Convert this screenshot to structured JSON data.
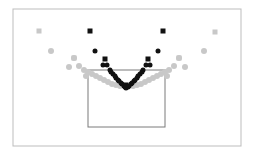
{
  "chart_data": {
    "type": "scatter",
    "title": "",
    "xlabel": "",
    "ylabel": "",
    "grid": false,
    "legend": null,
    "frame": {
      "x": 13,
      "y": 9,
      "w": 228,
      "h": 137,
      "stroke": "#bdbdbd"
    },
    "inner_box": {
      "x": 88,
      "y": 70,
      "w": 77,
      "h": 57,
      "stroke": "#7a7a7a"
    },
    "series": [
      {
        "name": "light",
        "color": "#c8c8c8",
        "marker": "circle",
        "points": [
          [
            51,
            51
          ],
          [
            204,
            51
          ],
          [
            74,
            58
          ],
          [
            179,
            58
          ],
          [
            69,
            67
          ],
          [
            79,
            66
          ],
          [
            174,
            66
          ],
          [
            185,
            67
          ],
          [
            88,
            72
          ],
          [
            92,
            74
          ],
          [
            96,
            76
          ],
          [
            100,
            78
          ],
          [
            104,
            80
          ],
          [
            108,
            82
          ],
          [
            112,
            84
          ],
          [
            116,
            85
          ],
          [
            120,
            86
          ],
          [
            165,
            72
          ],
          [
            161,
            74
          ],
          [
            157,
            76
          ],
          [
            153,
            78
          ],
          [
            149,
            80
          ],
          [
            145,
            82
          ],
          [
            141,
            84
          ],
          [
            137,
            85
          ],
          [
            133,
            86
          ],
          [
            86,
            76
          ],
          [
            167,
            76
          ],
          [
            84,
            70
          ],
          [
            169,
            70
          ]
        ]
      },
      {
        "name": "light-squares",
        "color": "#c8c8c8",
        "marker": "square",
        "points": [
          [
            39,
            31
          ],
          [
            215,
            32
          ],
          [
            179,
            58
          ],
          [
            74,
            58
          ]
        ]
      },
      {
        "name": "dark",
        "color": "#111111",
        "marker": "circle",
        "points": [
          [
            95,
            51
          ],
          [
            158,
            51
          ],
          [
            103,
            65
          ],
          [
            107,
            65
          ],
          [
            146,
            65
          ],
          [
            150,
            65
          ],
          [
            110,
            70
          ],
          [
            113,
            74
          ],
          [
            116,
            78
          ],
          [
            119,
            81
          ],
          [
            122,
            84
          ],
          [
            125,
            87
          ],
          [
            143,
            70
          ],
          [
            140,
            74
          ],
          [
            137,
            78
          ],
          [
            134,
            81
          ],
          [
            131,
            84
          ],
          [
            128,
            87
          ],
          [
            111,
            72
          ],
          [
            142,
            72
          ],
          [
            115,
            76
          ],
          [
            138,
            76
          ],
          [
            118,
            80
          ],
          [
            135,
            80
          ],
          [
            121,
            83
          ],
          [
            132,
            83
          ],
          [
            124,
            86
          ],
          [
            129,
            86
          ],
          [
            126,
            88
          ]
        ]
      },
      {
        "name": "dark-squares",
        "color": "#111111",
        "marker": "square",
        "points": [
          [
            90,
            31
          ],
          [
            163,
            31
          ],
          [
            105,
            59
          ],
          [
            148,
            59
          ],
          [
            126,
            85
          ]
        ]
      }
    ]
  }
}
